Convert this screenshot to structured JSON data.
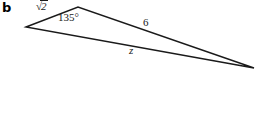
{
  "figure": {
    "part_label": "b",
    "background_color": "#ffffff",
    "stroke_color": "#1a1a1a",
    "text_color": "#1a1a1a"
  },
  "labels": {
    "side_left": "√2",
    "side_left_radical_sign": "√",
    "side_left_radicand": "2",
    "angle_apex": "135°",
    "side_right": "6",
    "side_bottom": "z"
  },
  "geometry": {
    "type": "triangle",
    "vertices": [
      {
        "name": "left-vertex",
        "x": 26,
        "y": 27
      },
      {
        "name": "apex-vertex",
        "x": 78,
        "y": 7
      },
      {
        "name": "right-vertex",
        "x": 254,
        "y": 68
      }
    ],
    "edges": [
      {
        "name": "side-sqrt2",
        "from": "left-vertex",
        "to": "apex-vertex",
        "label": "√2"
      },
      {
        "name": "side-6",
        "from": "apex-vertex",
        "to": "right-vertex",
        "label": "6"
      },
      {
        "name": "side-z",
        "from": "left-vertex",
        "to": "right-vertex",
        "label": "z"
      }
    ],
    "angles": [
      {
        "name": "angle-at-apex",
        "at": "apex-vertex",
        "label": "135°"
      }
    ],
    "stroke_width": 1.4
  }
}
